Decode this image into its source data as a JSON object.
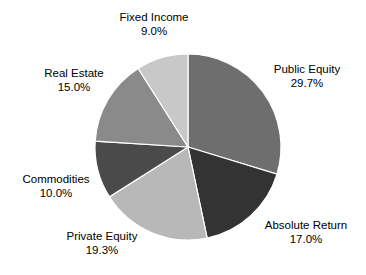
{
  "chart_data": {
    "type": "pie",
    "title": "",
    "subtitle": "",
    "xlabel": "",
    "ylabel": "",
    "grid": false,
    "legend": "none",
    "label_format": "name + percentage",
    "start_angle_deg": 0,
    "direction": "clockwise",
    "categories": [
      "Public Equity",
      "Absolute Return",
      "Private Equity",
      "Commodities",
      "Real Estate",
      "Fixed Income"
    ],
    "values": [
      29.7,
      17.0,
      19.3,
      10.0,
      15.0,
      9.0
    ],
    "value_labels": [
      "29.7%",
      "17.0%",
      "19.3%",
      "10.0%",
      "15.0%",
      "9.0%"
    ],
    "colors": [
      "#6e6e6e",
      "#333333",
      "#b8b8b8",
      "#4a4a4a",
      "#8a8a8a",
      "#c8c8c8"
    ],
    "slices": [
      {
        "name": "Public Equity",
        "value": 29.7,
        "label": "Public Equity",
        "pct_text": "29.7%",
        "color": "#6e6e6e"
      },
      {
        "name": "Absolute Return",
        "value": 17.0,
        "label": "Absolute Return",
        "pct_text": "17.0%",
        "color": "#333333"
      },
      {
        "name": "Private Equity",
        "value": 19.3,
        "label": "Private Equity",
        "pct_text": "19.3%",
        "color": "#b8b8b8"
      },
      {
        "name": "Commodities",
        "value": 10.0,
        "label": "Commodities",
        "pct_text": "10.0%",
        "color": "#4a4a4a"
      },
      {
        "name": "Real Estate",
        "value": 15.0,
        "label": "Real Estate",
        "pct_text": "15.0%",
        "color": "#8a8a8a"
      },
      {
        "name": "Fixed Income",
        "value": 9.0,
        "label": "Fixed Income",
        "pct_text": "9.0%",
        "color": "#c8c8c8"
      }
    ],
    "total": 100.0,
    "background_color": "#ffffff",
    "slice_border_color": "#ffffff"
  }
}
